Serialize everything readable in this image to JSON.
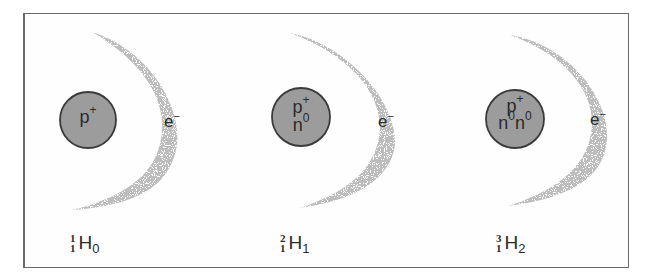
{
  "diagram": {
    "colors": {
      "nucleus_fill": "#9c9c9c",
      "nucleus_stroke": "#3a3a3a",
      "cloud": "#a8a8a8",
      "frame": "#6a6a6a",
      "text": "#2a2a2a"
    },
    "isotopes": [
      {
        "name": "protium",
        "nucleus": {
          "proton": "p",
          "proton_charge": "+",
          "neutrons": []
        },
        "electron": {
          "symbol": "e",
          "charge": "−"
        },
        "notation": {
          "mass_number": "1",
          "atomic_number": "1",
          "symbol": "H",
          "neutron_count": "0"
        }
      },
      {
        "name": "deuterium",
        "nucleus": {
          "proton": "p",
          "proton_charge": "+",
          "neutrons": [
            "n0"
          ]
        },
        "electron": {
          "symbol": "e",
          "charge": "−"
        },
        "notation": {
          "mass_number": "2",
          "atomic_number": "1",
          "symbol": "H",
          "neutron_count": "1"
        }
      },
      {
        "name": "tritium",
        "nucleus": {
          "proton": "p",
          "proton_charge": "+",
          "neutrons": [
            "n0",
            "n0"
          ]
        },
        "electron": {
          "symbol": "e",
          "charge": "−"
        },
        "notation": {
          "mass_number": "3",
          "atomic_number": "1",
          "symbol": "H",
          "neutron_count": "2"
        }
      }
    ],
    "neutron_symbol": "n",
    "neutron_charge": "0"
  }
}
